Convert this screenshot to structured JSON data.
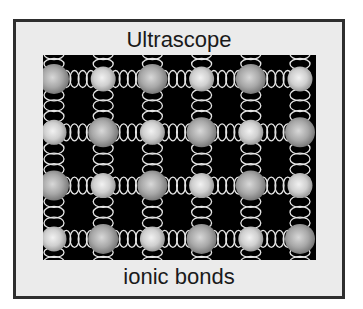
{
  "figure": {
    "title": "Ultrascope",
    "caption": "ionic bonds"
  },
  "lattice": {
    "rows": 4,
    "cols": 6,
    "pattern": [
      [
        "large",
        "small",
        "large",
        "small",
        "large",
        "small"
      ],
      [
        "small",
        "large",
        "small",
        "large",
        "small",
        "large"
      ],
      [
        "large",
        "small",
        "large",
        "small",
        "large",
        "small"
      ],
      [
        "small",
        "large",
        "small",
        "large",
        "small",
        "large"
      ]
    ],
    "bond_type": "spring",
    "colors": {
      "background": "#000000",
      "spring": "#e6e6e6",
      "large_ion": "#9a9a9a",
      "small_ion": "#c8c8c8",
      "frame_fill": "#ebebeb",
      "frame_border": "#2e2e2e"
    }
  }
}
